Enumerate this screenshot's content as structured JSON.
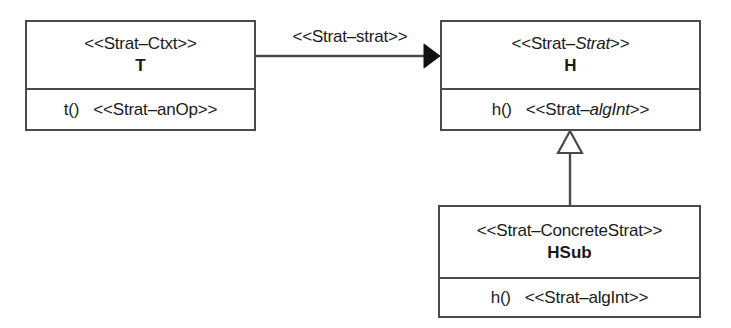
{
  "diagram": {
    "kind": "uml-class-diagram",
    "colors": {
      "background": "#ffffff",
      "stroke": "#4a4a4a",
      "text": "#1a1a1a",
      "arrow_fill_solid": "#111111",
      "arrow_fill_hollow": "#ffffff"
    }
  },
  "classes": {
    "context": {
      "stereotype_prefix": "<<Strat–",
      "stereotype_role": "Ctxt",
      "stereotype_suffix": ">>",
      "stereotype_full": "<<Strat–Ctxt>>",
      "name": "T",
      "operation_signature": "t()",
      "operation_stereotype_prefix": "<<Strat–",
      "operation_stereotype_role": "anOp",
      "operation_stereotype_suffix": ">>",
      "operation_stereotype_full": "<<Strat–anOp>>"
    },
    "strategy": {
      "stereotype_prefix": "<<Strat–",
      "stereotype_role": "Strat",
      "stereotype_suffix": ">>",
      "stereotype_full": "<<Strat–Strat>>",
      "stereotype_role_italic": true,
      "name": "H",
      "operation_signature": "h()",
      "operation_stereotype_prefix": "<<Strat–",
      "operation_stereotype_role": "algInt",
      "operation_stereotype_suffix": ">>",
      "operation_stereotype_full": "<<Strat–algInt>>",
      "operation_stereotype_role_italic": true
    },
    "concrete_strategy": {
      "stereotype_prefix": "<<Strat–",
      "stereotype_role": "ConcreteStrat",
      "stereotype_suffix": ">>",
      "stereotype_full": "<<Strat–ConcreteStrat>>",
      "stereotype_role_italic": false,
      "name": "HSub",
      "operation_signature": "h()",
      "operation_stereotype_prefix": "<<Strat–",
      "operation_stereotype_role": "algInt",
      "operation_stereotype_suffix": ">>",
      "operation_stereotype_full": "<<Strat–algInt>>",
      "operation_stereotype_role_italic": false
    }
  },
  "relationships": {
    "association": {
      "label": "<<Strat–strat>>",
      "from": "T",
      "to": "H",
      "arrowhead": "solid-filled-triangle"
    },
    "generalization": {
      "label": "",
      "from": "HSub",
      "to": "H",
      "arrowhead": "hollow-triangle"
    }
  }
}
